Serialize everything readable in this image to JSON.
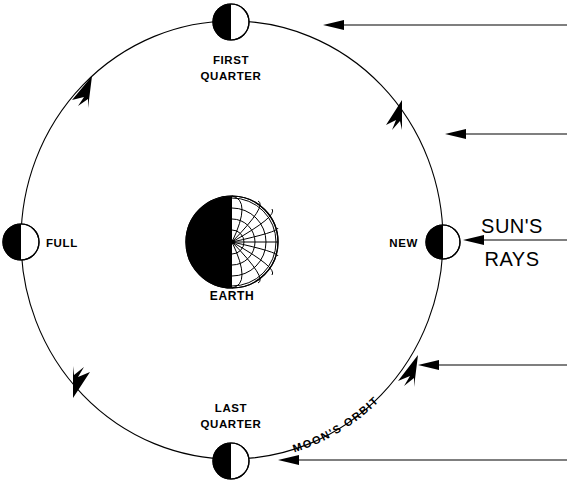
{
  "diagram": {
    "background_color": "#ffffff",
    "ink_color": "#000000",
    "canvas": {
      "width": 567,
      "height": 485
    }
  },
  "earth": {
    "label": "EARTH",
    "center": {
      "x": 232,
      "y": 242
    },
    "radius": 46,
    "dark_side": "left",
    "lit_side": "right",
    "grid_meridians": 9,
    "grid_parallels": 4
  },
  "orbit": {
    "label": "MOON'S ORBIT",
    "center": {
      "x": 232,
      "y": 240
    },
    "rx": 211,
    "ry": 219,
    "direction": "counterclockwise",
    "direction_marker_count": 3
  },
  "moons": [
    {
      "name": "first-quarter",
      "label_line1": "FIRST",
      "label_line2": "QUARTER",
      "center": {
        "x": 231,
        "y": 22
      },
      "radius": 18,
      "dark_side": "left",
      "lit_side": "right",
      "label_position": "below"
    },
    {
      "name": "full",
      "label_line1": "FULL",
      "label_line2": "",
      "center": {
        "x": 21,
        "y": 242
      },
      "radius": 18,
      "dark_side": "left",
      "lit_side": "right",
      "label_position": "right"
    },
    {
      "name": "last-quarter",
      "label_line1": "LAST",
      "label_line2": "QUARTER",
      "center": {
        "x": 231,
        "y": 461
      },
      "radius": 18,
      "dark_side": "left",
      "lit_side": "right",
      "label_position": "above"
    },
    {
      "name": "new",
      "label_line1": "NEW",
      "label_line2": "",
      "center": {
        "x": 443,
        "y": 242
      },
      "radius": 17,
      "dark_side": "left",
      "lit_side": "right",
      "label_position": "left"
    }
  ],
  "sun_rays": {
    "label_line1": "SUN'S",
    "label_line2": "RAYS",
    "direction": "leftward",
    "count": 5,
    "lines": [
      {
        "y": 25,
        "x_start": 323,
        "x_end": 567
      },
      {
        "y": 134,
        "x_start": 445,
        "x_end": 567
      },
      {
        "y": 240,
        "x_start": 463,
        "x_end": 567
      },
      {
        "y": 365,
        "x_start": 418,
        "x_end": 567
      },
      {
        "y": 460,
        "x_start": 278,
        "x_end": 567
      }
    ]
  },
  "caption": {
    "text": "",
    "visible": false
  }
}
